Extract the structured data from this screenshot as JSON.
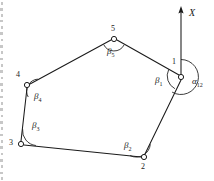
{
  "figure": {
    "background_color": "#ffffff",
    "line_color": "#1a1a1a",
    "canvas": {
      "width": 214,
      "height": 181
    }
  },
  "axis": {
    "label": "X",
    "label_x": 189,
    "label_y": 8,
    "arrow_tip": {
      "x": 181,
      "y": 7
    },
    "arrow_base": {
      "x": 181,
      "y": 74
    }
  },
  "stations": [
    {
      "id": "1",
      "label": "1",
      "x": 181,
      "y": 77,
      "label_x": 172,
      "label_y": 58
    },
    {
      "id": "2",
      "label": "2",
      "x": 144,
      "y": 157,
      "label_x": 141,
      "label_y": 163
    },
    {
      "id": "3",
      "label": "3",
      "x": 21,
      "y": 144,
      "label_x": 9,
      "label_y": 139
    },
    {
      "id": "4",
      "label": "4",
      "x": 27,
      "y": 85,
      "label_x": 16,
      "label_y": 71
    },
    {
      "id": "5",
      "label": "5",
      "x": 114,
      "y": 39,
      "label_x": 111,
      "label_y": 25
    }
  ],
  "legs": [
    {
      "from": "1",
      "to": "2"
    },
    {
      "from": "2",
      "to": "3"
    },
    {
      "from": "3",
      "to": "4"
    },
    {
      "from": "4",
      "to": "5"
    },
    {
      "from": "5",
      "to": "1"
    }
  ],
  "angles": [
    {
      "name": "beta-1",
      "symbol": "β",
      "subscript": "1",
      "at_station": "1",
      "label_x": 155,
      "label_y": 76
    },
    {
      "name": "beta-2",
      "symbol": "β",
      "subscript": "2",
      "at_station": "2",
      "label_x": 124,
      "label_y": 141
    },
    {
      "name": "beta-3",
      "symbol": "β",
      "subscript": "3",
      "at_station": "3",
      "label_x": 32,
      "label_y": 121
    },
    {
      "name": "beta-4",
      "symbol": "β",
      "subscript": "4",
      "at_station": "4",
      "label_x": 34,
      "label_y": 92
    },
    {
      "name": "beta-5",
      "symbol": "β",
      "subscript": "5",
      "at_station": "5",
      "label_x": 107,
      "label_y": 47
    }
  ],
  "bearing": {
    "name": "alpha-12",
    "symbol": "α",
    "subscript": "12",
    "from_station": "1",
    "to_station": "2",
    "label_x": 192,
    "label_y": 77
  }
}
